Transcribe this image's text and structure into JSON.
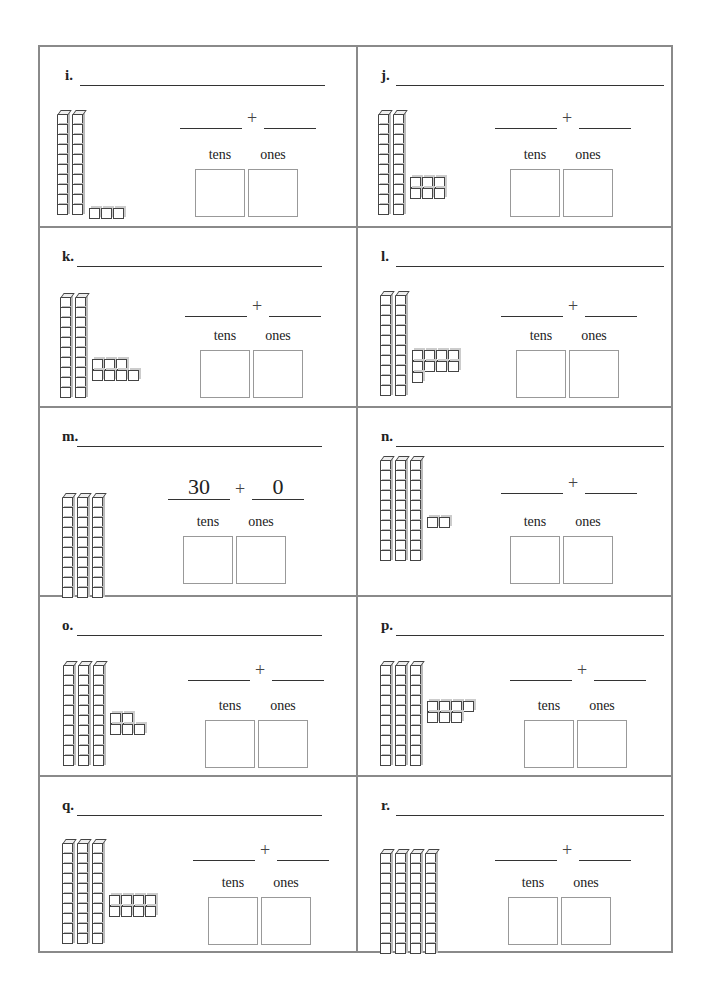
{
  "worksheet": {
    "column_labels": {
      "tens": "tens",
      "ones": "ones"
    },
    "plus": "+",
    "problems": [
      {
        "id": "i",
        "label": "i.",
        "tens": 2,
        "ones": 3,
        "ones_layout": [
          3
        ],
        "tens_answer": "",
        "ones_answer": ""
      },
      {
        "id": "j",
        "label": "j.",
        "tens": 2,
        "ones": 6,
        "ones_layout": [
          3,
          3
        ],
        "tens_answer": "",
        "ones_answer": ""
      },
      {
        "id": "k",
        "label": "k.",
        "tens": 2,
        "ones": 7,
        "ones_layout": [
          3,
          4
        ],
        "tens_answer": "",
        "ones_answer": ""
      },
      {
        "id": "l",
        "label": "l.",
        "tens": 2,
        "ones": 9,
        "ones_layout": [
          4,
          4,
          1
        ],
        "tens_answer": "",
        "ones_answer": ""
      },
      {
        "id": "m",
        "label": "m.",
        "tens": 3,
        "ones": 0,
        "ones_layout": [],
        "tens_answer": "30",
        "ones_answer": "0"
      },
      {
        "id": "n",
        "label": "n.",
        "tens": 3,
        "ones": 2,
        "ones_layout": [
          2
        ],
        "tens_answer": "",
        "ones_answer": ""
      },
      {
        "id": "o",
        "label": "o.",
        "tens": 3,
        "ones": 5,
        "ones_layout": [
          2,
          3
        ],
        "tens_answer": "",
        "ones_answer": ""
      },
      {
        "id": "p",
        "label": "p.",
        "tens": 3,
        "ones": 7,
        "ones_layout": [
          4,
          3
        ],
        "tens_answer": "",
        "ones_answer": ""
      },
      {
        "id": "q",
        "label": "q.",
        "tens": 3,
        "ones": 8,
        "ones_layout": [
          4,
          4
        ],
        "tens_answer": "",
        "ones_answer": ""
      },
      {
        "id": "r",
        "label": "r.",
        "tens": 4,
        "ones": 0,
        "ones_layout": [],
        "tens_answer": "",
        "ones_answer": ""
      }
    ]
  }
}
